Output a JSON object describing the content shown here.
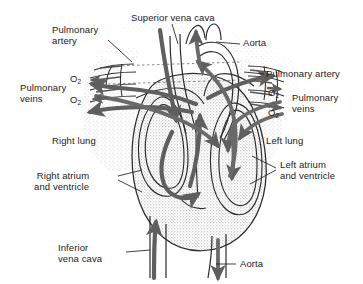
{
  "figure": {
    "background_color": "#ffffff",
    "ink_color": "#1b1b1b",
    "flow_arrow_color": "#5f5f5f",
    "stipple_color": "#8a8a8a"
  },
  "labels": {
    "pulmonary_artery_left": "Pulmonary\nartery",
    "superior_vena_cava": "Superior vena cava",
    "aorta_top": "Aorta",
    "pulmonary_veins_left": "Pulmonary\nveins",
    "pulmonary_artery_right": "Pulmonary artery",
    "pulmonary_veins_right": "Pulmonary\nveins",
    "right_lung": "Right lung",
    "left_lung": "Left lung",
    "right_atrium_and_ventricle": "Right atrium\nand ventricle",
    "left_atrium_and_ventricle": "Left atrium\nand ventricle",
    "inferior_vena_cava": "Inferior\nvena cava",
    "aorta_bottom": "Aorta"
  },
  "oxygen_marks": [
    {
      "id": "o2-left-upper",
      "text": "O",
      "subscript": "2"
    },
    {
      "id": "o2-left-lower",
      "text": "O",
      "subscript": "2"
    },
    {
      "id": "o2-right-upper",
      "text": "O",
      "subscript": "2"
    },
    {
      "id": "o2-right-lower",
      "text": "O",
      "subscript": "2"
    }
  ],
  "structures": [
    {
      "name": "right-lung",
      "kind": "organ"
    },
    {
      "name": "left-lung",
      "kind": "organ"
    },
    {
      "name": "heart-body",
      "kind": "organ"
    },
    {
      "name": "right-atrium",
      "kind": "chamber"
    },
    {
      "name": "right-ventricle",
      "kind": "chamber"
    },
    {
      "name": "left-atrium",
      "kind": "chamber"
    },
    {
      "name": "left-ventricle",
      "kind": "chamber"
    },
    {
      "name": "aortic-arch",
      "kind": "vessel"
    },
    {
      "name": "superior-vena-cava-vessel",
      "kind": "vessel"
    },
    {
      "name": "inferior-vena-cava-vessel",
      "kind": "vessel"
    },
    {
      "name": "pulmonary-trunk",
      "kind": "vessel"
    },
    {
      "name": "descending-aorta",
      "kind": "vessel"
    }
  ]
}
